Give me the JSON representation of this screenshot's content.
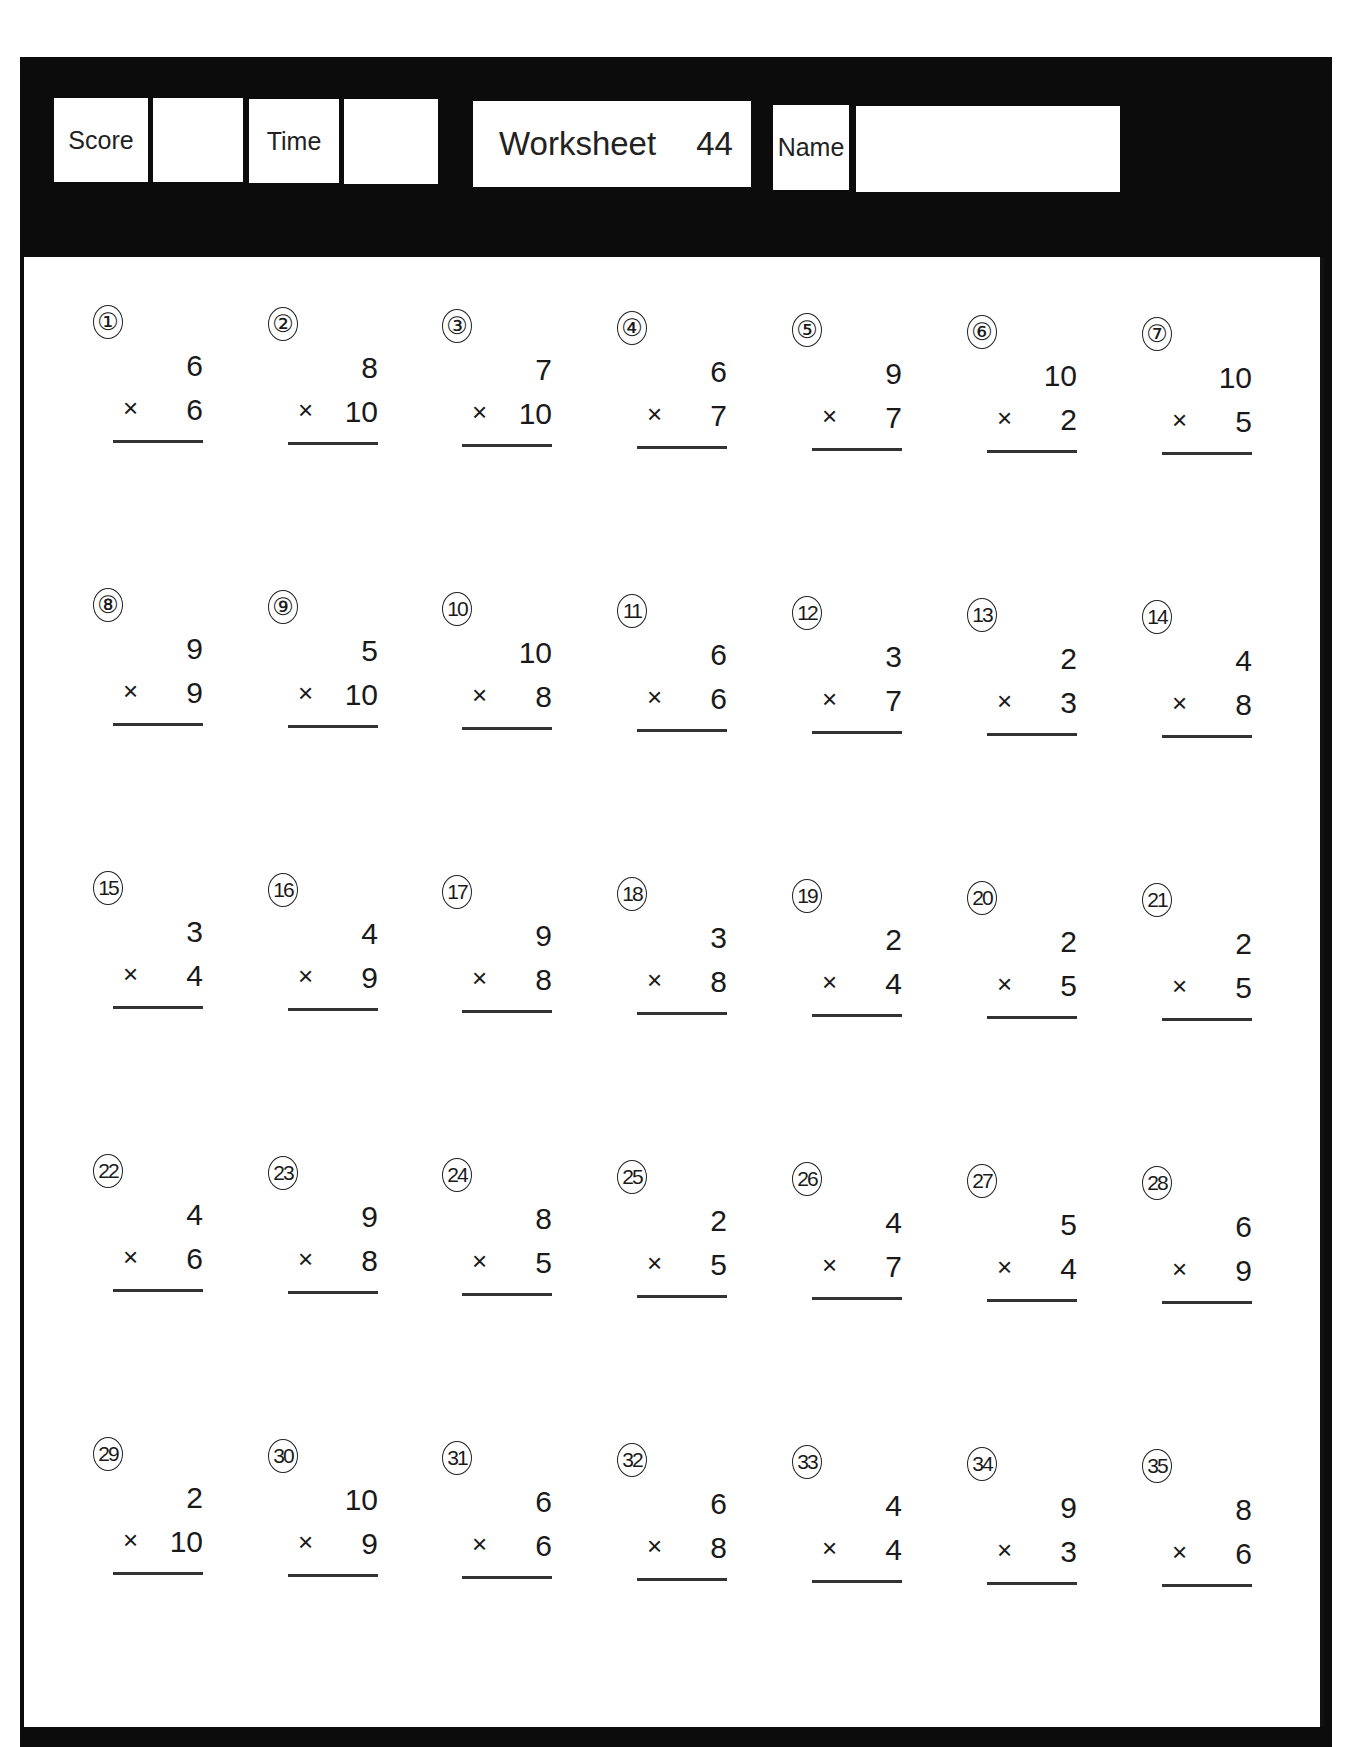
{
  "header": {
    "score_label": "Score",
    "score_value": "",
    "time_label": "Time",
    "time_value": "",
    "worksheet_label": "Worksheet",
    "worksheet_number": "44",
    "name_label": "Name",
    "name_value": ""
  },
  "operator_symbol": "×",
  "problems": [
    {
      "n": "①",
      "a": "6",
      "b": "6"
    },
    {
      "n": "②",
      "a": "8",
      "b": "10"
    },
    {
      "n": "③",
      "a": "7",
      "b": "10"
    },
    {
      "n": "④",
      "a": "6",
      "b": "7"
    },
    {
      "n": "⑤",
      "a": "9",
      "b": "7"
    },
    {
      "n": "⑥",
      "a": "10",
      "b": "2"
    },
    {
      "n": "⑦",
      "a": "10",
      "b": "5"
    },
    {
      "n": "⑧",
      "a": "9",
      "b": "9"
    },
    {
      "n": "⑨",
      "a": "5",
      "b": "10"
    },
    {
      "n": "10",
      "a": "10",
      "b": "8"
    },
    {
      "n": "11",
      "a": "6",
      "b": "6"
    },
    {
      "n": "12",
      "a": "3",
      "b": "7"
    },
    {
      "n": "13",
      "a": "2",
      "b": "3"
    },
    {
      "n": "14",
      "a": "4",
      "b": "8"
    },
    {
      "n": "15",
      "a": "3",
      "b": "4"
    },
    {
      "n": "16",
      "a": "4",
      "b": "9"
    },
    {
      "n": "17",
      "a": "9",
      "b": "8"
    },
    {
      "n": "18",
      "a": "3",
      "b": "8"
    },
    {
      "n": "19",
      "a": "2",
      "b": "4"
    },
    {
      "n": "20",
      "a": "2",
      "b": "5"
    },
    {
      "n": "21",
      "a": "2",
      "b": "5"
    },
    {
      "n": "22",
      "a": "4",
      "b": "6"
    },
    {
      "n": "23",
      "a": "9",
      "b": "8"
    },
    {
      "n": "24",
      "a": "8",
      "b": "5"
    },
    {
      "n": "25",
      "a": "2",
      "b": "5"
    },
    {
      "n": "26",
      "a": "4",
      "b": "7"
    },
    {
      "n": "27",
      "a": "5",
      "b": "4"
    },
    {
      "n": "28",
      "a": "6",
      "b": "9"
    },
    {
      "n": "29",
      "a": "2",
      "b": "10"
    },
    {
      "n": "30",
      "a": "10",
      "b": "9"
    },
    {
      "n": "31",
      "a": "6",
      "b": "6"
    },
    {
      "n": "32",
      "a": "6",
      "b": "8"
    },
    {
      "n": "33",
      "a": "4",
      "b": "4"
    },
    {
      "n": "34",
      "a": "9",
      "b": "3"
    },
    {
      "n": "35",
      "a": "8",
      "b": "6"
    }
  ]
}
